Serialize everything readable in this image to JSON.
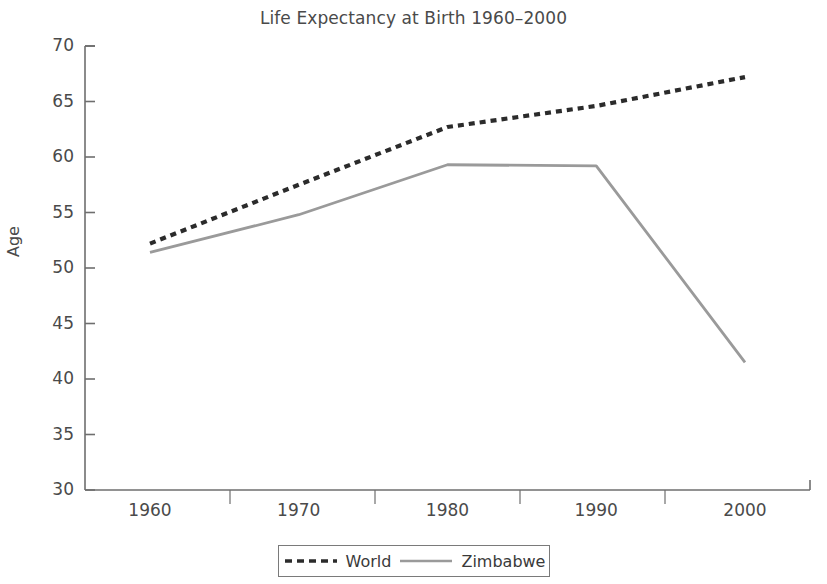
{
  "chart_data": {
    "type": "line",
    "title": "Life Expectancy at Birth 1960–2000",
    "xlabel": "",
    "ylabel": "Age",
    "x": [
      1960,
      1970,
      1980,
      1990,
      2000
    ],
    "xtick_labels": [
      "1960",
      "1970",
      "1980",
      "1990",
      "2000"
    ],
    "ytick_labels": [
      "30",
      "35",
      "40",
      "45",
      "50",
      "55",
      "60",
      "65",
      "70"
    ],
    "ytick_values": [
      30,
      35,
      40,
      45,
      50,
      55,
      60,
      65,
      70
    ],
    "xlim": [
      1960,
      2000
    ],
    "ylim": [
      30,
      70
    ],
    "grid": false,
    "legend_position": "bottom-center",
    "series": [
      {
        "name": "World",
        "values": [
          52.2,
          57.5,
          62.7,
          64.6,
          67.2
        ],
        "color": "#2b2b2b",
        "style": "dashed"
      },
      {
        "name": "Zimbabwe",
        "values": [
          51.4,
          54.8,
          59.3,
          59.2,
          41.5
        ],
        "color": "#9a9a9a",
        "style": "solid"
      }
    ]
  },
  "axes": {
    "axis_color": "#6e6e6e",
    "text_color": "#4a4a4a"
  },
  "legend": {
    "entries": [
      {
        "label": "World",
        "icon": "dashed-line-swatch"
      },
      {
        "label": "Zimbabwe",
        "icon": "solid-line-swatch"
      }
    ]
  }
}
